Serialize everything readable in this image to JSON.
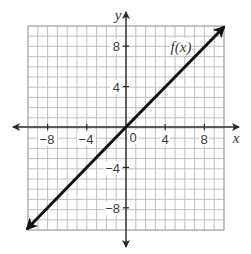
{
  "chart_data": {
    "type": "line",
    "title": "",
    "xlabel": "x",
    "ylabel": "y",
    "xlim": [
      -10,
      10
    ],
    "ylim": [
      -10,
      10
    ],
    "grid": true,
    "grid_step": 1,
    "x_ticks": [
      -8,
      -4,
      0,
      4,
      8
    ],
    "y_ticks": [
      -8,
      -4,
      4,
      8
    ],
    "x_tick_labels": [
      "−8",
      "−4",
      "4",
      "8"
    ],
    "y_tick_labels": [
      "8",
      "4",
      "−4",
      "−8"
    ],
    "origin_label": "0",
    "legend": [],
    "series": [
      {
        "name": "f(x)",
        "equation": "f(x) = x",
        "slope": 1,
        "intercept": 0,
        "arrows_both_ends": true,
        "x": [
          -10,
          -8,
          -4,
          0,
          4,
          8,
          10
        ],
        "y": [
          -10,
          -8,
          -4,
          0,
          4,
          8,
          10
        ]
      }
    ],
    "annotations": [
      {
        "text": "f(x)",
        "x": 5,
        "y": 8,
        "attached_to": "f(x)"
      }
    ]
  },
  "labels": {
    "x_axis": "x",
    "y_axis": "y",
    "origin": "0",
    "function": "f(x)",
    "x_neg8": "−8",
    "x_neg4": "−4",
    "x_pos4": "4",
    "x_pos8": "8",
    "y_pos8": "8",
    "y_pos4": "4",
    "y_neg4": "−4",
    "y_neg8": "−8"
  },
  "colors": {
    "grid": "#b9b9b9",
    "axis": "#2a2a2a",
    "function_line": "#111111",
    "background": "#ffffff"
  }
}
